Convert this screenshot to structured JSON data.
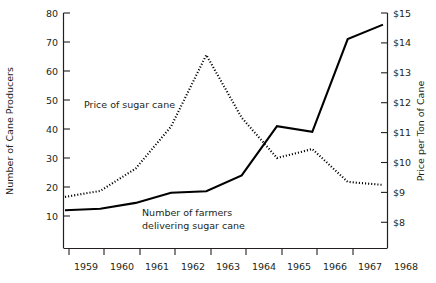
{
  "chart_data": {
    "type": "line",
    "title": "",
    "xlabel": "",
    "ylabel": "Number of Cane Producers",
    "y2label": "Price per Ton of Cane",
    "grid": false,
    "legend_position": "inline-annotations",
    "x": [
      "1959",
      "1960",
      "1961",
      "1962",
      "1963",
      "1964",
      "1965",
      "1966",
      "1967",
      "1968"
    ],
    "xticklabels": [
      "1959",
      "1960",
      "1961",
      "1962",
      "1963",
      "1964",
      "1965",
      "1966",
      "1967",
      "1968"
    ],
    "yticklabels": [
      "10",
      "20",
      "30",
      "40",
      "50",
      "60",
      "70",
      "80"
    ],
    "ytickvalues": [
      10,
      20,
      30,
      40,
      50,
      60,
      70,
      80
    ],
    "ylim": [
      5,
      80
    ],
    "y2ticklabels": [
      "$8",
      "$9",
      "$10",
      "$11",
      "$12",
      "$13",
      "$14",
      "$15"
    ],
    "y2tickvalues": [
      8,
      9,
      10,
      11,
      12,
      13,
      14,
      15
    ],
    "y2lim": [
      7.5,
      15
    ],
    "series": [
      {
        "name": "Number of farmers delivering sugar cane",
        "style": "solid",
        "axis": "left",
        "units": "Number of Cane Producers",
        "values": [
          12,
          12.5,
          14.5,
          18,
          18.5,
          24,
          41,
          39,
          71,
          76
        ]
      },
      {
        "name": "Price of sugar cane",
        "style": "dotted",
        "axis": "right",
        "units": "Price per Ton of Cane (dollars)",
        "values": [
          8.85,
          9.05,
          9.8,
          11.2,
          13.6,
          11.5,
          10.15,
          10.45,
          9.35,
          9.25
        ]
      }
    ],
    "annotations": [
      {
        "id": "price-label",
        "text": "Price of sugar cane"
      },
      {
        "id": "farmers-label-line1",
        "text": "Number of farmers"
      },
      {
        "id": "farmers-label-line2",
        "text": "delivering sugar cane"
      }
    ]
  },
  "colors": {
    "ink": "#231f20",
    "series_solid": "#000000",
    "series_dotted": "#000000",
    "background": "#ffffff"
  }
}
